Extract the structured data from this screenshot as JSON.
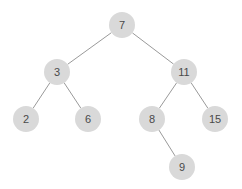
{
  "diagram": {
    "type": "binary-tree",
    "colors": {
      "node_fill": "#d9d9d9",
      "edge": "#9a9a9a",
      "text": "#4a4a4a",
      "background": "#ffffff"
    },
    "nodes": [
      {
        "id": "n7",
        "label": "7",
        "x": 122,
        "y": 25
      },
      {
        "id": "n3",
        "label": "3",
        "x": 57,
        "y": 72
      },
      {
        "id": "n11",
        "label": "11",
        "x": 184,
        "y": 72
      },
      {
        "id": "n2",
        "label": "2",
        "x": 26,
        "y": 119
      },
      {
        "id": "n6",
        "label": "6",
        "x": 88,
        "y": 119
      },
      {
        "id": "n8",
        "label": "8",
        "x": 152,
        "y": 119
      },
      {
        "id": "n15",
        "label": "15",
        "x": 215,
        "y": 119
      },
      {
        "id": "n9",
        "label": "9",
        "x": 182,
        "y": 167
      }
    ],
    "edges": [
      [
        "n7",
        "n3"
      ],
      [
        "n7",
        "n11"
      ],
      [
        "n3",
        "n2"
      ],
      [
        "n3",
        "n6"
      ],
      [
        "n11",
        "n8"
      ],
      [
        "n11",
        "n15"
      ],
      [
        "n8",
        "n9"
      ]
    ]
  }
}
